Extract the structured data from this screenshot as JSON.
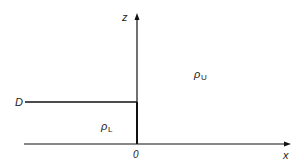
{
  "diagram": {
    "axes": {
      "vertical_label": "z",
      "horizontal_label": "x",
      "origin_label": "0"
    },
    "interface": {
      "depth_label": "D"
    },
    "regions": [
      {
        "name": "upper",
        "symbol": "ρ",
        "subscript": "U"
      },
      {
        "name": "lower",
        "symbol": "ρ",
        "subscript": "L"
      }
    ],
    "colors": {
      "line": "#111111",
      "text": "#222222",
      "background": "#ffffff"
    }
  }
}
